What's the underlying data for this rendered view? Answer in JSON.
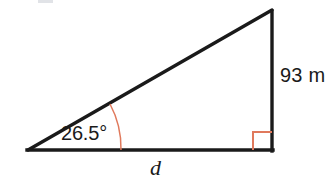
{
  "figure": {
    "kind": "right-triangle-trigonometry-diagram",
    "background_color": "#ffffff",
    "stroke_color": "#1a1a1a",
    "marker_color": "#e0795c",
    "labels": {
      "angle": "26.5°",
      "height": "93 m",
      "base": "d"
    },
    "geometry": {
      "left_vertex": [
        28,
        150
      ],
      "right_angle_vertex": [
        272,
        150
      ],
      "apex": [
        272,
        10
      ],
      "angle_degrees": 26.5,
      "height_value": 93,
      "height_unit": "m",
      "base_variable": "d"
    },
    "markers": {
      "angle_arc": "arc-26-5-degrees",
      "right_angle_square": "right-angle-square"
    }
  }
}
